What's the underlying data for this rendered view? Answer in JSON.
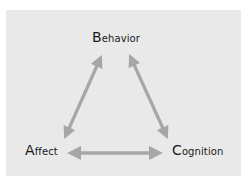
{
  "diagram": {
    "type": "triangle-bidirectional",
    "colors": {
      "background": "#e9e9e9",
      "arrow": "#a6a6a6",
      "text": "#1a1a1a"
    },
    "nodes": [
      {
        "id": "behavior",
        "initial": "B",
        "rest": "ehavior",
        "label": "Behavior"
      },
      {
        "id": "affect",
        "initial": "A",
        "rest": "ffect",
        "label": "Affect"
      },
      {
        "id": "cognition",
        "initial": "C",
        "rest": "ognition",
        "label": "Cognition"
      }
    ],
    "edges": [
      {
        "from": "behavior",
        "to": "affect",
        "bidirectional": true
      },
      {
        "from": "behavior",
        "to": "cognition",
        "bidirectional": true
      },
      {
        "from": "affect",
        "to": "cognition",
        "bidirectional": true
      }
    ]
  }
}
